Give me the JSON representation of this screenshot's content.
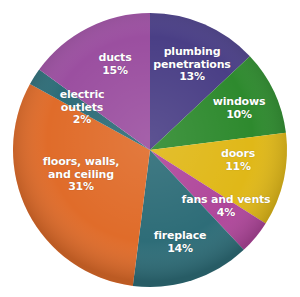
{
  "chart_data": {
    "type": "pie",
    "title": "",
    "subtitle": "",
    "xlabel": "",
    "ylabel": "",
    "legend_position": "none",
    "labels_inside": true,
    "start_angle_deg": 0,
    "direction": "clockwise",
    "categories": [
      "plumbing penetrations",
      "windows",
      "doors",
      "fans and vents",
      "fireplace",
      "floors, walls, and ceiling",
      "electric outlets",
      "ducts"
    ],
    "values": [
      13,
      10,
      11,
      4,
      14,
      31,
      2,
      15
    ],
    "value_labels": [
      "13%",
      "10%",
      "11%",
      "4%",
      "14%",
      "31%",
      "2%",
      "15%"
    ],
    "colors": [
      "#4a3f86",
      "#2e8a2e",
      "#e0b818",
      "#b0479b",
      "#2e6d78",
      "#e06c2a",
      "#2e6d78",
      "#9b4fa0"
    ],
    "slices": [
      {
        "name": "plumbing penetrations",
        "label_line1": "plumbing",
        "label_line2": "penetrations",
        "percent_label": "13%",
        "value": 13,
        "color": "#4a3f86"
      },
      {
        "name": "windows",
        "label_line1": "windows",
        "label_line2": "",
        "percent_label": "10%",
        "value": 10,
        "color": "#2e8a2e"
      },
      {
        "name": "doors",
        "label_line1": "doors",
        "label_line2": "",
        "percent_label": "11%",
        "value": 11,
        "color": "#e0b818"
      },
      {
        "name": "fans and vents",
        "label_line1": "fans and vents",
        "label_line2": "",
        "percent_label": "4%",
        "value": 4,
        "color": "#b0479b"
      },
      {
        "name": "fireplace",
        "label_line1": "fireplace",
        "label_line2": "",
        "percent_label": "14%",
        "value": 14,
        "color": "#2e6d78"
      },
      {
        "name": "floors, walls, and ceiling",
        "label_line1": "floors, walls,",
        "label_line2": "and ceiling",
        "percent_label": "31%",
        "value": 31,
        "color": "#e06c2a"
      },
      {
        "name": "electric outlets",
        "label_line1": "electric",
        "label_line2": "outlets",
        "percent_label": "2%",
        "value": 2,
        "color": "#2e6d78"
      },
      {
        "name": "ducts",
        "label_line1": "ducts",
        "label_line2": "",
        "percent_label": "15%",
        "value": 15,
        "color": "#9b4fa0"
      }
    ],
    "total": 100,
    "background_color": "#ffffff",
    "label_text_color": "#ffffff"
  }
}
